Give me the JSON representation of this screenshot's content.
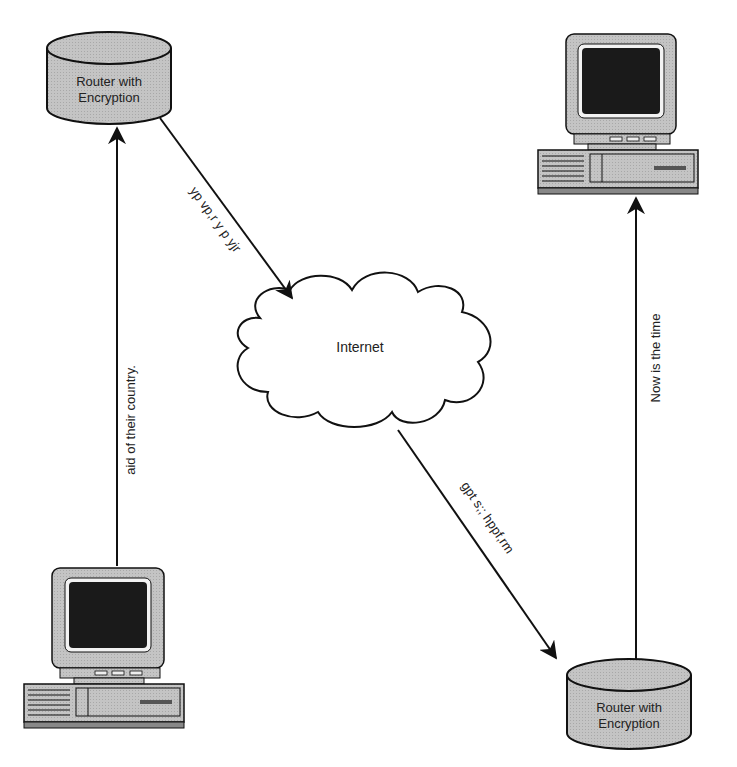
{
  "diagram": {
    "nodes": {
      "router_top_left": {
        "label_line1": "Router with",
        "label_line2": "Encryption"
      },
      "router_bottom_right": {
        "label_line1": "Router with",
        "label_line2": "Encryption"
      },
      "cloud": {
        "label": "Internet"
      },
      "computer_bottom_left": {
        "label": ""
      },
      "computer_top_right": {
        "label": ""
      }
    },
    "edges": {
      "plain_left": {
        "label": "aid of their country."
      },
      "cipher_in": {
        "label": "yp vp,r y p yjr"
      },
      "cipher_out": {
        "label": "gpt s;; hppf,rm"
      },
      "plain_right": {
        "label": "Now is the time"
      }
    },
    "colors": {
      "router_fill": "#b8b8b8",
      "router_top": "#c8c8c8",
      "computer_body": "#cfcfcf",
      "screen": "#1a1a1a",
      "stroke": "#111111"
    }
  }
}
